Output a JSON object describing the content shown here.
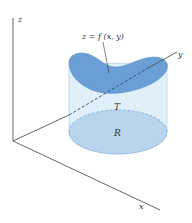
{
  "labels": {
    "z_axis": "z",
    "y_axis": "y",
    "x_axis": "x",
    "surface": "z = f (x, y)",
    "solid": "T",
    "region": "R"
  },
  "colors": {
    "surface": "#6a9fd6",
    "cylinder_side": "#dcecf7",
    "region": "#b9d5ee",
    "axis": "#555555"
  }
}
